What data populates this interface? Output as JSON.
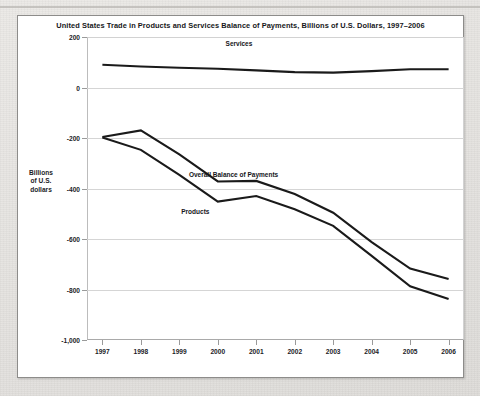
{
  "card": {
    "title": "United States Trade in Products and Services Balance of Payments, Billions of U.S. Dollars, 1997–2006"
  },
  "axis": {
    "y_title_line1": "Billions",
    "y_title_line2": "of U.S.",
    "y_title_line3": "dollars"
  },
  "chart_data": {
    "type": "line",
    "title": "United States Trade in Products and Services Balance of Payments, Billions of U.S. Dollars, 1997–2006",
    "xlabel": "",
    "ylabel": "Billions of U.S. dollars",
    "x": [
      1997,
      1998,
      1999,
      2000,
      2001,
      2002,
      2003,
      2004,
      2005,
      2006
    ],
    "xtick_labels": [
      "1997",
      "1998",
      "1999",
      "2000",
      "2001",
      "2002",
      "2003",
      "2004",
      "2005",
      "2006"
    ],
    "xlim": [
      1996.6,
      2006.4
    ],
    "ylim": [
      -1000,
      200
    ],
    "ytick_labels": [
      "200",
      "0",
      "-200",
      "-400",
      "-600",
      "-800",
      "-1,000"
    ],
    "yticks": [
      200,
      0,
      -200,
      -400,
      -600,
      -800,
      -1000
    ],
    "grid": true,
    "legend": "inline-labels",
    "series": [
      {
        "name": "Services",
        "label": "Services",
        "values": [
          90,
          83,
          78,
          74,
          68,
          61,
          59,
          65,
          72,
          72
        ]
      },
      {
        "name": "Overall Balance of Payments",
        "label": "Overall Balance of Payments",
        "values": [
          -196,
          -170,
          -265,
          -372,
          -370,
          -422,
          -496,
          -612,
          -717,
          -758
        ]
      },
      {
        "name": "Products",
        "label": "Products",
        "values": [
          -198,
          -247,
          -346,
          -452,
          -430,
          -482,
          -548,
          -667,
          -787,
          -838
        ]
      }
    ]
  }
}
